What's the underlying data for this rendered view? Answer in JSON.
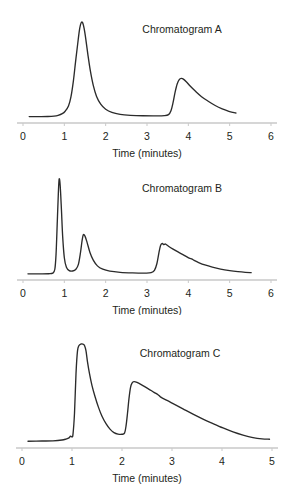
{
  "figure": {
    "background": "#ffffff",
    "trace_color": "#2b2b2b",
    "axis_color": "#c9c9c9",
    "text_color": "#231f20"
  },
  "chart_data": [
    {
      "type": "line",
      "title": "Chromatogram A",
      "xlabel": "Time (minutes)",
      "ylabel": "",
      "xlim": [
        0,
        6
      ],
      "ylim": [
        0,
        1
      ],
      "xticks": [
        0,
        1,
        2,
        3,
        4,
        5,
        6
      ],
      "xticklabels": [
        "0",
        "1",
        "2",
        "3",
        "4",
        "5",
        "6"
      ],
      "grid": false,
      "legend": "none",
      "trace_xrange": [
        0.15,
        5.15
      ],
      "peaks": [
        {
          "time": 1.42,
          "height": 1.0,
          "shape": "sharp-gaussian-tailed",
          "width": 0.22
        },
        {
          "time": 3.85,
          "height": 0.41,
          "shape": "sharp-rise-long-tail",
          "width": 0.55
        }
      ],
      "x": [
        0.15,
        0.4,
        0.6,
        0.75,
        0.85,
        0.95,
        1.02,
        1.1,
        1.16,
        1.22,
        1.27,
        1.32,
        1.36,
        1.39,
        1.42,
        1.45,
        1.48,
        1.52,
        1.57,
        1.63,
        1.7,
        1.78,
        1.88,
        2.0,
        2.15,
        2.35,
        2.6,
        2.9,
        3.2,
        3.42,
        3.52,
        3.58,
        3.63,
        3.68,
        3.73,
        3.78,
        3.83,
        3.88,
        3.95,
        4.05,
        4.18,
        4.32,
        4.48,
        4.65,
        4.82,
        4.98,
        5.08,
        5.15
      ],
      "y": [
        0.015,
        0.015,
        0.016,
        0.02,
        0.028,
        0.045,
        0.07,
        0.125,
        0.22,
        0.39,
        0.58,
        0.76,
        0.9,
        0.97,
        1.0,
        0.985,
        0.93,
        0.82,
        0.66,
        0.49,
        0.34,
        0.225,
        0.145,
        0.092,
        0.058,
        0.038,
        0.028,
        0.023,
        0.022,
        0.024,
        0.035,
        0.075,
        0.16,
        0.27,
        0.355,
        0.4,
        0.412,
        0.405,
        0.378,
        0.33,
        0.275,
        0.222,
        0.175,
        0.13,
        0.095,
        0.07,
        0.058,
        0.052
      ]
    },
    {
      "type": "line",
      "title": "Chromatogram B",
      "xlabel": "Time (minutes)",
      "ylabel": "",
      "xlim": [
        0,
        6
      ],
      "ylim": [
        0,
        1
      ],
      "xticks": [
        0,
        1,
        2,
        3,
        4,
        5,
        6
      ],
      "xticklabels": [
        "0",
        "1",
        "2",
        "3",
        "4",
        "5",
        "6"
      ],
      "grid": false,
      "legend": "none",
      "trace_xrange": [
        0.12,
        5.52
      ],
      "peaks": [
        {
          "time": 0.86,
          "height": 1.0,
          "shape": "very-narrow-spike",
          "width": 0.09
        },
        {
          "time": 1.46,
          "height": 0.42,
          "shape": "gaussian-tailed",
          "width": 0.17
        },
        {
          "time": 3.32,
          "height": 0.33,
          "shape": "sharp-rise-long-tail-with-shoulder",
          "width": 0.9
        }
      ],
      "x": [
        0.12,
        0.4,
        0.62,
        0.72,
        0.77,
        0.8,
        0.83,
        0.855,
        0.875,
        0.9,
        0.93,
        0.96,
        1.0,
        1.05,
        1.12,
        1.2,
        1.28,
        1.34,
        1.39,
        1.43,
        1.46,
        1.5,
        1.55,
        1.62,
        1.7,
        1.8,
        1.93,
        2.1,
        2.35,
        2.65,
        2.95,
        3.1,
        3.18,
        3.24,
        3.29,
        3.33,
        3.37,
        3.4,
        3.45,
        3.52,
        3.62,
        3.75,
        3.9,
        4.02,
        4.08,
        4.14,
        4.25,
        4.4,
        4.58,
        4.78,
        5.0,
        5.2,
        5.38,
        5.52
      ],
      "y": [
        0.012,
        0.012,
        0.013,
        0.02,
        0.06,
        0.22,
        0.56,
        0.85,
        1.0,
        0.93,
        0.68,
        0.4,
        0.18,
        0.08,
        0.045,
        0.042,
        0.06,
        0.11,
        0.23,
        0.36,
        0.42,
        0.405,
        0.34,
        0.235,
        0.155,
        0.095,
        0.06,
        0.04,
        0.028,
        0.022,
        0.02,
        0.024,
        0.048,
        0.12,
        0.235,
        0.31,
        0.33,
        0.318,
        0.322,
        0.3,
        0.272,
        0.24,
        0.205,
        0.175,
        0.168,
        0.152,
        0.13,
        0.105,
        0.082,
        0.062,
        0.046,
        0.035,
        0.028,
        0.025
      ]
    },
    {
      "type": "line",
      "title": "Chromatogram C",
      "xlabel": "Time (minutes)",
      "ylabel": "",
      "xlim": [
        0,
        5
      ],
      "ylim": [
        0,
        1
      ],
      "xticks": [
        0,
        1,
        2,
        3,
        4,
        5
      ],
      "xticklabels": [
        "0",
        "1",
        "2",
        "3",
        "4",
        "5"
      ],
      "grid": false,
      "legend": "none",
      "trace_xrange": [
        0.12,
        4.95
      ],
      "peaks": [
        {
          "time": 1.18,
          "height": 1.0,
          "shape": "flat-topped-saturated",
          "width": 0.3
        },
        {
          "time": 2.22,
          "height": 0.62,
          "shape": "sharp-rise-long-tail-with-shoulder",
          "width": 1.4
        }
      ],
      "x": [
        0.12,
        0.4,
        0.62,
        0.8,
        0.88,
        0.94,
        0.97,
        1.0,
        1.02,
        1.05,
        1.08,
        1.11,
        1.14,
        1.18,
        1.22,
        1.25,
        1.28,
        1.31,
        1.35,
        1.4,
        1.46,
        1.53,
        1.6,
        1.68,
        1.76,
        1.84,
        1.92,
        2.0,
        2.05,
        2.08,
        2.11,
        2.14,
        2.17,
        2.2,
        2.24,
        2.3,
        2.4,
        2.52,
        2.64,
        2.72,
        2.76,
        2.8,
        2.9,
        3.05,
        3.22,
        3.42,
        3.62,
        3.82,
        4.02,
        4.22,
        4.42,
        4.62,
        4.8,
        4.95
      ],
      "y": [
        0.018,
        0.02,
        0.022,
        0.03,
        0.04,
        0.052,
        0.07,
        0.062,
        0.09,
        0.3,
        0.7,
        0.93,
        0.985,
        1.0,
        0.998,
        0.985,
        0.93,
        0.82,
        0.7,
        0.58,
        0.47,
        0.36,
        0.27,
        0.195,
        0.14,
        0.105,
        0.09,
        0.088,
        0.1,
        0.17,
        0.3,
        0.45,
        0.56,
        0.605,
        0.62,
        0.612,
        0.585,
        0.55,
        0.512,
        0.488,
        0.47,
        0.455,
        0.43,
        0.39,
        0.345,
        0.292,
        0.242,
        0.196,
        0.152,
        0.112,
        0.08,
        0.055,
        0.042,
        0.038
      ]
    }
  ]
}
